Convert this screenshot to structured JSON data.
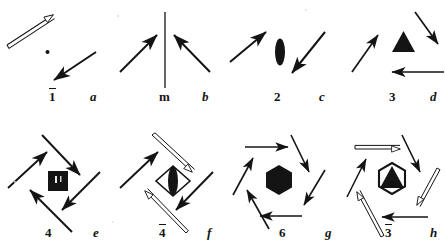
{
  "figure": {
    "type": "crystallographic-symmetry-diagram",
    "width": 445,
    "height": 243,
    "background_color": "#ffffff",
    "ink_color": "#141414",
    "rows": 2,
    "columns": 4
  },
  "panels": [
    {
      "id": "panel-1bar",
      "symbol_label": "1",
      "symbol_overbar": true,
      "letter_label": "a",
      "row": 1,
      "column": 1,
      "symmetry_order": 1,
      "operation": "inversion",
      "center_glyph": "point",
      "arrow_count": 2,
      "arrows": [
        {
          "kind": "open-double-line",
          "direction": "up-right"
        },
        {
          "kind": "solid",
          "direction": "down-left"
        }
      ]
    },
    {
      "id": "panel-m",
      "symbol_label": "m",
      "symbol_overbar": false,
      "letter_label": "b",
      "row": 1,
      "column": 2,
      "symmetry_order": 2,
      "operation": "mirror",
      "center_glyph": "mirror-line",
      "arrow_count": 2,
      "arrows": [
        {
          "kind": "solid",
          "direction": "up-right"
        },
        {
          "kind": "solid",
          "direction": "up-left"
        }
      ]
    },
    {
      "id": "panel-2",
      "symbol_label": "2",
      "symbol_overbar": false,
      "letter_label": "c",
      "row": 1,
      "column": 3,
      "symmetry_order": 2,
      "operation": "two-fold rotation",
      "center_glyph": "filled-lens",
      "arrow_count": 2,
      "arrows": [
        {
          "kind": "solid",
          "direction": "up-right"
        },
        {
          "kind": "solid",
          "direction": "down-right"
        }
      ]
    },
    {
      "id": "panel-3",
      "symbol_label": "3",
      "symbol_overbar": false,
      "letter_label": "d",
      "row": 1,
      "column": 4,
      "symmetry_order": 3,
      "operation": "three-fold rotation",
      "center_glyph": "filled-triangle",
      "arrow_count": 3,
      "arrows": [
        {
          "kind": "solid",
          "direction": "up-right"
        },
        {
          "kind": "solid",
          "direction": "down-right"
        },
        {
          "kind": "solid",
          "direction": "left"
        }
      ]
    },
    {
      "id": "panel-4",
      "symbol_label": "4",
      "symbol_overbar": false,
      "letter_label": "e",
      "row": 2,
      "column": 1,
      "symmetry_order": 4,
      "operation": "four-fold rotation",
      "center_glyph": "filled-square",
      "arrow_count": 4,
      "arrows": [
        {
          "kind": "solid",
          "direction": "down-right"
        },
        {
          "kind": "solid",
          "direction": "down-left"
        },
        {
          "kind": "solid",
          "direction": "up-left"
        },
        {
          "kind": "solid",
          "direction": "up-right"
        }
      ]
    },
    {
      "id": "panel-4bar",
      "symbol_label": "4",
      "symbol_overbar": true,
      "letter_label": "f",
      "row": 2,
      "column": 2,
      "symmetry_order": 4,
      "operation": "four-fold rotoinversion",
      "center_glyph": "lens-in-diamond",
      "arrow_count": 4,
      "arrows": [
        {
          "kind": "open-double-line",
          "direction": "down-right"
        },
        {
          "kind": "solid",
          "direction": "down-left"
        },
        {
          "kind": "open-double-line",
          "direction": "up-left"
        },
        {
          "kind": "solid",
          "direction": "up-right"
        }
      ]
    },
    {
      "id": "panel-6",
      "symbol_label": "6",
      "symbol_overbar": false,
      "letter_label": "g",
      "row": 2,
      "column": 3,
      "symmetry_order": 6,
      "operation": "six-fold rotation",
      "center_glyph": "filled-hexagon",
      "arrow_count": 6,
      "arrows": [
        {
          "kind": "solid",
          "direction": "right"
        },
        {
          "kind": "solid",
          "direction": "down-right"
        },
        {
          "kind": "solid",
          "direction": "down-left"
        },
        {
          "kind": "solid",
          "direction": "left"
        },
        {
          "kind": "solid",
          "direction": "up-left"
        },
        {
          "kind": "solid",
          "direction": "up-right"
        }
      ]
    },
    {
      "id": "panel-3bar",
      "symbol_label": "3",
      "symbol_overbar": true,
      "letter_label": "h",
      "row": 2,
      "column": 4,
      "symmetry_order": 6,
      "operation": "three-fold rotoinversion",
      "center_glyph": "triangle-in-hexagon",
      "arrow_count": 6,
      "arrows": [
        {
          "kind": "open-double-line",
          "direction": "right"
        },
        {
          "kind": "solid",
          "direction": "down-right"
        },
        {
          "kind": "open-double-line",
          "direction": "down-left"
        },
        {
          "kind": "solid",
          "direction": "left"
        },
        {
          "kind": "open-double-line",
          "direction": "up-left"
        },
        {
          "kind": "solid",
          "direction": "up-right"
        }
      ]
    }
  ]
}
